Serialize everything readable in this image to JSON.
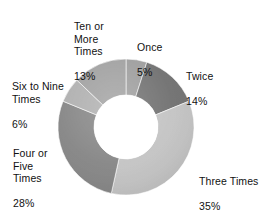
{
  "chart_data": {
    "type": "pie",
    "variant": "donut",
    "title": "",
    "subtitle": "",
    "xlabel": "",
    "ylabel": "",
    "grid": false,
    "legend": "none",
    "labels_position": "outside-with-leader-less",
    "units": "percent",
    "start_angle_deg": 0,
    "direction": "clockwise",
    "center": {
      "x": 126,
      "y": 127
    },
    "outer_radius": 68,
    "inner_radius": 32,
    "categories": [
      "Once",
      "Twice",
      "Three Times",
      "Four or Five Times",
      "Six to Nine Times",
      "Ten or More Times"
    ],
    "values": [
      5,
      14,
      35,
      28,
      6,
      13
    ],
    "slices": [
      {
        "name": "Once",
        "label_lines": "Once",
        "value": 5,
        "value_label": "5%",
        "color": "#9c9c9c",
        "start_deg": 0,
        "end_deg": 18
      },
      {
        "name": "Twice",
        "label_lines": "Twice",
        "value": 14,
        "value_label": "14%",
        "color": "#6f6f6f",
        "start_deg": 18,
        "end_deg": 68.4
      },
      {
        "name": "Three Times",
        "label_lines": "Three Times",
        "value": 35,
        "value_label": "35%",
        "color": "#c3c3c3",
        "start_deg": 68.4,
        "end_deg": 194.4
      },
      {
        "name": "Four or Five Times",
        "label_lines": "Four or\nFive\nTimes",
        "value": 28,
        "value_label": "28%",
        "color": "#848484",
        "start_deg": 194.4,
        "end_deg": 295.2
      },
      {
        "name": "Six to Nine Times",
        "label_lines": "Six to Nine\nTimes",
        "value": 6,
        "value_label": "6%",
        "color": "#aeaeae",
        "start_deg": 295.2,
        "end_deg": 316.8
      },
      {
        "name": "Ten or More Times",
        "label_lines": "Ten or\nMore\nTimes",
        "value": 13,
        "value_label": "13%",
        "color": "#9f9f9f",
        "start_deg": 316.8,
        "end_deg": 363.6
      }
    ],
    "background_color": "#ffffff",
    "text_color": "#111111"
  }
}
